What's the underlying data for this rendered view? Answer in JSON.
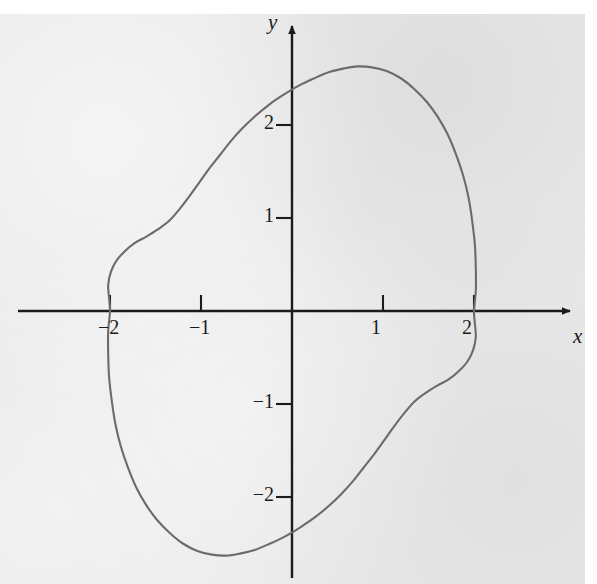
{
  "figure": {
    "kind": "math-plot",
    "background_color": "#e9e9e9",
    "page_color": "#ffffff",
    "curve_color": "#6b6b6b",
    "axis_color": "#1b1b1b"
  },
  "axes": {
    "x_axis_label": "x",
    "y_axis_label": "y",
    "origin_px": {
      "x": 292,
      "y": 311
    },
    "unit_px": {
      "x": 91,
      "y": 93
    },
    "x_ticks": [
      {
        "value": -2,
        "label": "−2",
        "px": 110
      },
      {
        "value": -1,
        "label": "−1",
        "px": 201
      },
      {
        "value": 1,
        "label": "1",
        "px": 383
      },
      {
        "value": 2,
        "label": "2",
        "px": 474
      }
    ],
    "y_ticks": [
      {
        "value": 2,
        "label": "2",
        "px": 122
      },
      {
        "value": 1,
        "label": "1",
        "px": 220
      },
      {
        "value": -1,
        "label": "−1",
        "px": 403
      },
      {
        "value": -2,
        "label": "−2",
        "px": 495
      }
    ]
  },
  "chart_data": {
    "type": "line",
    "title": "",
    "xlabel": "x",
    "ylabel": "y",
    "grid": false,
    "legend": "none",
    "xlim": [
      -2.6,
      3.2
    ],
    "ylim": [
      -2.9,
      3.0
    ],
    "x_tick_values": [
      -2,
      -1,
      1,
      2
    ],
    "y_tick_values": [
      -2,
      -1,
      1,
      2
    ],
    "annotations": [
      {
        "label": "x-intercept",
        "x": -2,
        "y": 0
      },
      {
        "label": "x-intercept",
        "x": 2,
        "y": 0
      },
      {
        "label": "maximum",
        "x": 0.72,
        "y": 2.63
      },
      {
        "label": "minimum",
        "x": -0.87,
        "y": -2.63
      }
    ],
    "series": [
      {
        "name": "closed curve",
        "closed": true,
        "color": "#6b6b6b",
        "points": [
          [
            -2.0,
            0.0
          ],
          [
            -2.01,
            0.14
          ],
          [
            -2.02,
            0.28
          ],
          [
            -1.99,
            0.42
          ],
          [
            -1.93,
            0.54
          ],
          [
            -1.84,
            0.64
          ],
          [
            -1.73,
            0.73
          ],
          [
            -1.6,
            0.8
          ],
          [
            -1.47,
            0.88
          ],
          [
            -1.35,
            0.97
          ],
          [
            -1.24,
            1.09
          ],
          [
            -1.13,
            1.23
          ],
          [
            -1.02,
            1.38
          ],
          [
            -0.91,
            1.53
          ],
          [
            -0.79,
            1.68
          ],
          [
            -0.67,
            1.83
          ],
          [
            -0.54,
            1.97
          ],
          [
            -0.4,
            2.1
          ],
          [
            -0.25,
            2.22
          ],
          [
            -0.1,
            2.32
          ],
          [
            0.07,
            2.42
          ],
          [
            0.24,
            2.5
          ],
          [
            0.41,
            2.57
          ],
          [
            0.58,
            2.61
          ],
          [
            0.72,
            2.63
          ],
          [
            0.88,
            2.62
          ],
          [
            1.04,
            2.58
          ],
          [
            1.2,
            2.5
          ],
          [
            1.34,
            2.39
          ],
          [
            1.48,
            2.25
          ],
          [
            1.6,
            2.09
          ],
          [
            1.71,
            1.9
          ],
          [
            1.8,
            1.69
          ],
          [
            1.88,
            1.46
          ],
          [
            1.94,
            1.22
          ],
          [
            1.98,
            0.97
          ],
          [
            2.01,
            0.71
          ],
          [
            2.02,
            0.45
          ],
          [
            2.02,
            0.22
          ],
          [
            2.0,
            0.0
          ],
          [
            2.01,
            -0.14
          ],
          [
            2.02,
            -0.28
          ],
          [
            1.99,
            -0.42
          ],
          [
            1.93,
            -0.54
          ],
          [
            1.84,
            -0.64
          ],
          [
            1.73,
            -0.73
          ],
          [
            1.6,
            -0.8
          ],
          [
            1.47,
            -0.88
          ],
          [
            1.35,
            -0.97
          ],
          [
            1.24,
            -1.09
          ],
          [
            1.13,
            -1.23
          ],
          [
            1.02,
            -1.38
          ],
          [
            0.91,
            -1.53
          ],
          [
            0.79,
            -1.68
          ],
          [
            0.67,
            -1.83
          ],
          [
            0.54,
            -1.97
          ],
          [
            0.4,
            -2.1
          ],
          [
            0.25,
            -2.22
          ],
          [
            0.1,
            -2.32
          ],
          [
            -0.07,
            -2.42
          ],
          [
            -0.24,
            -2.5
          ],
          [
            -0.41,
            -2.57
          ],
          [
            -0.58,
            -2.61
          ],
          [
            -0.72,
            -2.63
          ],
          [
            -0.88,
            -2.62
          ],
          [
            -1.04,
            -2.58
          ],
          [
            -1.2,
            -2.5
          ],
          [
            -1.34,
            -2.39
          ],
          [
            -1.48,
            -2.25
          ],
          [
            -1.6,
            -2.09
          ],
          [
            -1.71,
            -1.9
          ],
          [
            -1.8,
            -1.69
          ],
          [
            -1.88,
            -1.46
          ],
          [
            -1.94,
            -1.22
          ],
          [
            -1.98,
            -0.97
          ],
          [
            -2.01,
            -0.71
          ],
          [
            -2.02,
            -0.45
          ],
          [
            -2.02,
            -0.22
          ]
        ]
      }
    ]
  }
}
